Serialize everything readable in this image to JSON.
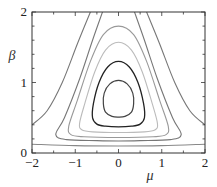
{
  "chart_data": {
    "type": "contour",
    "title": "",
    "xlabel": "μ",
    "ylabel": "β",
    "xlim": [
      -2,
      2
    ],
    "ylim": [
      0,
      2
    ],
    "xticks": [
      -2,
      -1,
      0,
      1,
      2
    ],
    "xtick_labels": [
      "−2",
      "−1",
      "0",
      "1",
      "2"
    ],
    "yticks": [
      0,
      1,
      2
    ],
    "ytick_labels": [
      "0",
      "1",
      "2"
    ],
    "grid": false,
    "legend": null,
    "frame": {
      "left": 32,
      "right": 205,
      "top": 12,
      "bottom": 153
    },
    "contours": [
      {
        "id": "c1",
        "closed": true,
        "color": "#444444",
        "width": 1.2,
        "points": [
          [
            0,
            1.03
          ],
          [
            0.2,
            0.98
          ],
          [
            0.33,
            0.85
          ],
          [
            0.35,
            0.7
          ],
          [
            0.3,
            0.58
          ],
          [
            0.15,
            0.52
          ],
          [
            0,
            0.51
          ],
          [
            -0.15,
            0.52
          ],
          [
            -0.3,
            0.58
          ],
          [
            -0.35,
            0.7
          ],
          [
            -0.33,
            0.85
          ],
          [
            -0.2,
            0.98
          ]
        ]
      },
      {
        "id": "c2",
        "closed": true,
        "color": "#222222",
        "width": 1.3,
        "points": [
          [
            0,
            1.3
          ],
          [
            0.25,
            1.22
          ],
          [
            0.45,
            1.0
          ],
          [
            0.58,
            0.7
          ],
          [
            0.6,
            0.5
          ],
          [
            0.5,
            0.41
          ],
          [
            0.3,
            0.38
          ],
          [
            0,
            0.37
          ],
          [
            -0.3,
            0.38
          ],
          [
            -0.5,
            0.41
          ],
          [
            -0.6,
            0.5
          ],
          [
            -0.58,
            0.7
          ],
          [
            -0.45,
            1.0
          ],
          [
            -0.25,
            1.22
          ]
        ]
      },
      {
        "id": "c3",
        "closed": true,
        "color": "#bbbbbb",
        "width": 1.1,
        "points": [
          [
            0,
            1.57
          ],
          [
            0.3,
            1.46
          ],
          [
            0.55,
            1.15
          ],
          [
            0.78,
            0.7
          ],
          [
            0.9,
            0.42
          ],
          [
            0.85,
            0.33
          ],
          [
            0.6,
            0.3
          ],
          [
            0,
            0.29
          ],
          [
            -0.6,
            0.3
          ],
          [
            -0.85,
            0.33
          ],
          [
            -0.9,
            0.42
          ],
          [
            -0.78,
            0.7
          ],
          [
            -0.55,
            1.15
          ],
          [
            -0.3,
            1.46
          ]
        ]
      },
      {
        "id": "c4",
        "closed": true,
        "color": "#999999",
        "width": 1.1,
        "points": [
          [
            0,
            1.8
          ],
          [
            0.35,
            1.68
          ],
          [
            0.65,
            1.3
          ],
          [
            0.95,
            0.75
          ],
          [
            1.15,
            0.38
          ],
          [
            1.1,
            0.26
          ],
          [
            0.8,
            0.23
          ],
          [
            0,
            0.22
          ],
          [
            -0.8,
            0.23
          ],
          [
            -1.1,
            0.26
          ],
          [
            -1.15,
            0.38
          ],
          [
            -0.95,
            0.75
          ],
          [
            -0.65,
            1.3
          ],
          [
            -0.35,
            1.68
          ]
        ]
      },
      {
        "id": "c5",
        "closed": false,
        "color": "#777777",
        "width": 1.1,
        "points": [
          [
            -0.37,
            2.0
          ],
          [
            -0.6,
            1.6
          ],
          [
            -0.9,
            1.05
          ],
          [
            -1.25,
            0.5
          ],
          [
            -1.45,
            0.26
          ],
          [
            -1.2,
            0.19
          ],
          [
            -0.5,
            0.175
          ],
          [
            0,
            0.17
          ],
          [
            0.5,
            0.175
          ],
          [
            1.2,
            0.19
          ],
          [
            1.45,
            0.26
          ],
          [
            1.25,
            0.5
          ],
          [
            0.9,
            1.05
          ],
          [
            0.6,
            1.6
          ],
          [
            0.37,
            2.0
          ]
        ]
      },
      {
        "id": "c6",
        "closed": false,
        "color": "#777777",
        "width": 1.1,
        "points": [
          [
            -0.65,
            2.0
          ],
          [
            -0.95,
            1.55
          ],
          [
            -1.3,
            1.0
          ],
          [
            -1.65,
            0.6
          ],
          [
            -2.0,
            0.4
          ]
        ]
      },
      {
        "id": "c6r",
        "closed": false,
        "color": "#777777",
        "width": 1.1,
        "points": [
          [
            0.65,
            2.0
          ],
          [
            0.95,
            1.55
          ],
          [
            1.3,
            1.0
          ],
          [
            1.65,
            0.6
          ],
          [
            2.0,
            0.4
          ]
        ]
      },
      {
        "id": "c7",
        "closed": false,
        "color": "#888888",
        "width": 1.1,
        "points": [
          [
            -2.0,
            0.125
          ],
          [
            -1.0,
            0.105
          ],
          [
            0,
            0.1
          ],
          [
            1.0,
            0.105
          ],
          [
            2.0,
            0.125
          ]
        ]
      }
    ]
  }
}
